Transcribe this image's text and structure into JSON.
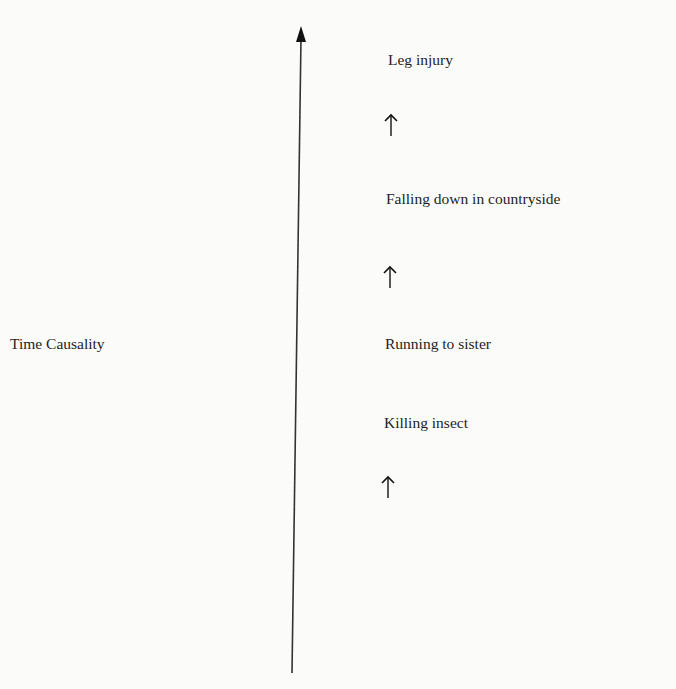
{
  "axis": {
    "label": "Time Causality",
    "direction": "up"
  },
  "events": [
    {
      "label": "Leg injury"
    },
    {
      "label": "Falling down in countryside"
    },
    {
      "label": "Running to sister"
    },
    {
      "label": "Killing insect"
    }
  ],
  "arrows": [
    {
      "icon": "up-arrow-icon",
      "between": "Falling down in countryside -> Leg injury"
    },
    {
      "icon": "up-arrow-icon",
      "between": "Running to sister -> Falling down in countryside"
    },
    {
      "icon": "up-arrow-icon",
      "below": "Killing insect"
    }
  ],
  "colors": {
    "ink": "#1e1e1e",
    "background": "#fbfbfa"
  }
}
